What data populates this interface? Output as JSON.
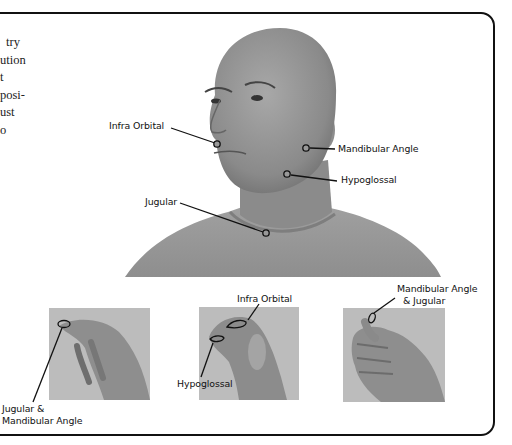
{
  "page": {
    "body_text_fragments": [
      "try",
      "ution",
      "t",
      "posi-",
      "ust",
      "o"
    ]
  },
  "main_figure": {
    "description": "Portrait photo of a bald man, head turned, with labeled pressure points",
    "labels": {
      "infra_orbital": "Infra Orbital",
      "mandibular_angle": "Mandibular Angle",
      "hypoglossal": "Hypoglossal",
      "jugular": "Jugular"
    }
  },
  "hand_figures": [
    {
      "description": "Hand with fingertips pointing, marking the point of contact",
      "label_line1": "Jugular &",
      "label_line2": "Mandibular Angle"
    },
    {
      "description": "Hand with bent knuckles, marking two contact areas",
      "label_top": "Infra Orbital",
      "label_bottom": "Hypoglossal"
    },
    {
      "description": "Fist with thumb tip marked",
      "label_line1": "Mandibular Angle",
      "label_line2": "& Jugular"
    }
  ],
  "colors": {
    "border": "#111111",
    "photo_bg": "#bdbdbd",
    "skin": "#8f8f8f",
    "shirt": "#9a9a9a"
  }
}
